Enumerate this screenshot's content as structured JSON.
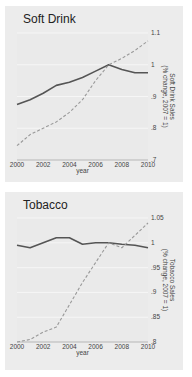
{
  "chart_data": [
    {
      "type": "line",
      "title": "Soft Drink",
      "xlabel": "year",
      "ylabel": "Soft Drink Sales\n(% change, 2007 = 1)",
      "y_axis_position": "right",
      "x": [
        2000,
        2001,
        2002,
        2003,
        2004,
        2005,
        2006,
        2007,
        2008,
        2009,
        2010
      ],
      "x_ticks": [
        "2000",
        "2002",
        "2004",
        "2006",
        "2008",
        "2010"
      ],
      "y_ticks": [
        ".7",
        ".8",
        ".9",
        "1",
        "1.1"
      ],
      "ylim": [
        0.7,
        1.1
      ],
      "xlim": [
        2000,
        2010
      ],
      "grid": true,
      "legend": null,
      "series": [
        {
          "name": "solid",
          "style": "solid",
          "color": "#555555",
          "values": [
            0.875,
            0.89,
            0.91,
            0.935,
            0.945,
            0.96,
            0.98,
            1.0,
            0.985,
            0.975,
            0.975
          ]
        },
        {
          "name": "dashed",
          "style": "dashed",
          "color": "#999999",
          "values": [
            0.745,
            0.78,
            0.8,
            0.82,
            0.85,
            0.89,
            0.95,
            1.0,
            1.02,
            1.045,
            1.075
          ]
        }
      ]
    },
    {
      "type": "line",
      "title": "Tobacco",
      "xlabel": "year",
      "ylabel": "Tobacco Sales\n(% change, 2007 = 1)",
      "y_axis_position": "right",
      "x": [
        2000,
        2001,
        2002,
        2003,
        2004,
        2005,
        2006,
        2007,
        2008,
        2009,
        2010
      ],
      "x_ticks": [
        "2000",
        "2002",
        "2004",
        "2006",
        "2008",
        "2010"
      ],
      "y_ticks": [
        ".8",
        ".85",
        ".9",
        ".95",
        "1",
        "1.05"
      ],
      "ylim": [
        0.8,
        1.05
      ],
      "xlim": [
        2000,
        2010
      ],
      "grid": true,
      "legend": null,
      "series": [
        {
          "name": "solid",
          "style": "solid",
          "color": "#555555",
          "values": [
            0.995,
            0.99,
            1.0,
            1.01,
            1.01,
            0.997,
            1.0,
            1.0,
            0.997,
            0.995,
            0.99
          ]
        },
        {
          "name": "dashed",
          "style": "dashed",
          "color": "#999999",
          "values": [
            0.8,
            0.805,
            0.82,
            0.83,
            0.875,
            0.92,
            0.96,
            1.0,
            0.99,
            1.015,
            1.04
          ]
        }
      ]
    }
  ]
}
